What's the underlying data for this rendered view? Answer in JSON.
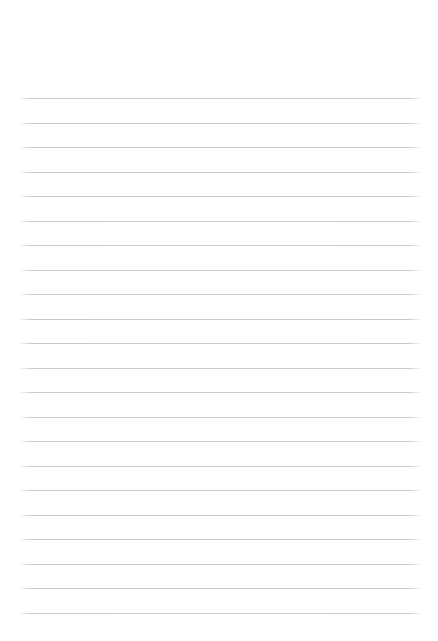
{
  "page": {
    "kind": "blank-ruled-notebook-page",
    "background_color": "#ffffff",
    "text_content": ""
  },
  "rules": {
    "line_count": 22,
    "line_color": "#c4c4c4"
  }
}
